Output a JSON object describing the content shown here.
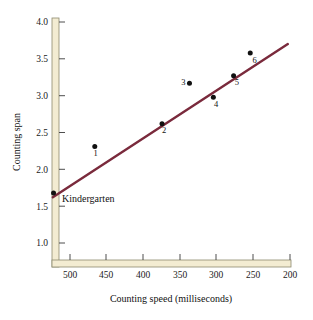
{
  "chart_data": {
    "type": "scatter",
    "title": "",
    "xlabel": "Counting speed (milliseconds)",
    "ylabel": "Counting span",
    "xlim": [
      520,
      195
    ],
    "ylim": [
      0.82,
      4.05
    ],
    "x_reversed": true,
    "grid": false,
    "legend": "none",
    "xticks": [
      500,
      450,
      400,
      350,
      300,
      250,
      200
    ],
    "xticklabels": [
      "500",
      "450",
      "400",
      "350",
      "300",
      "250",
      "200"
    ],
    "yticks": [
      1.0,
      1.5,
      2.0,
      2.5,
      3.0,
      3.5,
      4.0
    ],
    "yticklabels": [
      "1.0",
      "1.5",
      "2.0",
      "2.5",
      "3.0",
      "3.5",
      "4.0"
    ],
    "points": [
      {
        "label": "Kindergarten",
        "x": 522,
        "y": 1.68,
        "label_pos": "right"
      },
      {
        "label": "1",
        "x": 465,
        "y": 2.31,
        "label_pos": "below"
      },
      {
        "label": "2",
        "x": 372,
        "y": 2.62,
        "label_pos": "below"
      },
      {
        "label": "3",
        "x": 334,
        "y": 3.17,
        "label_pos": "left"
      },
      {
        "label": "4",
        "x": 301,
        "y": 2.98,
        "label_pos": "below"
      },
      {
        "label": "5",
        "x": 273,
        "y": 3.27,
        "label_pos": "below"
      },
      {
        "label": "6",
        "x": 250,
        "y": 3.58,
        "label_pos": "below"
      }
    ],
    "trendline": {
      "x_start": 523,
      "y_start": 1.62,
      "x_end": 198,
      "y_end": 3.7,
      "color": "#7a2a3c"
    },
    "marker_color": "#111111",
    "axis_color": "#8d8a6e",
    "axis_band_color": "#f3ecd2"
  }
}
